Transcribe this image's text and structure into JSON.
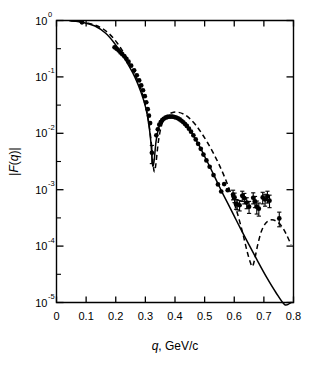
{
  "figure": {
    "name": "nuclear-form-factor-plot",
    "background": "#ffffff",
    "ink": "#000000"
  },
  "chart_data": {
    "type": "scatter",
    "title": "",
    "xlabel_italic": "q",
    "xlabel_rest": ", GeV/c",
    "xlabel": "q, GeV/c",
    "ylabel": "|F(q)|",
    "ylabel_parts": {
      "bar_left": "|",
      "f": "F",
      "paren_open": "(",
      "q": "q",
      "paren_close": ")",
      "bar_right": "|"
    },
    "xscale": "linear",
    "yscale": "log",
    "xlim": [
      0.0,
      0.8
    ],
    "ylim": [
      1e-05,
      1.0
    ],
    "grid": false,
    "legend": "none",
    "xticks": [
      0.0,
      0.1,
      0.2,
      0.3,
      0.4,
      0.5,
      0.6,
      0.7,
      0.8
    ],
    "xticklabels": [
      "0",
      "0.1",
      "0.2",
      "0.3",
      "0.4",
      "0.5",
      "0.6",
      "0.7",
      "0.8"
    ],
    "yticks": [
      1,
      0.1,
      0.01,
      0.001,
      0.0001,
      1e-05
    ],
    "yticklabels": [
      "10",
      "10",
      "10",
      "10",
      "10",
      "10"
    ],
    "ytickexponents": [
      "0",
      "-1",
      "-2",
      "-3",
      "-4",
      "-5"
    ],
    "yminor_ticks": [
      0.3162,
      0.03162,
      0.003162,
      0.0003162,
      3.162e-05
    ],
    "series": [
      {
        "name": "data",
        "style": "filled-circles-with-error-bars",
        "marker": "circle",
        "points": [
          {
            "x": 0.086,
            "y": 0.93,
            "err": 0.0
          },
          {
            "x": 0.196,
            "y": 0.335,
            "err": 0.0
          },
          {
            "x": 0.203,
            "y": 0.315,
            "err": 0.0
          },
          {
            "x": 0.21,
            "y": 0.295,
            "err": 0.0
          },
          {
            "x": 0.216,
            "y": 0.272,
            "err": 0.0
          },
          {
            "x": 0.222,
            "y": 0.253,
            "err": 0.0
          },
          {
            "x": 0.229,
            "y": 0.232,
            "err": 0.0
          },
          {
            "x": 0.236,
            "y": 0.209,
            "err": 0.0
          },
          {
            "x": 0.243,
            "y": 0.186,
            "err": 0.0
          },
          {
            "x": 0.252,
            "y": 0.158,
            "err": 0.0
          },
          {
            "x": 0.262,
            "y": 0.131,
            "err": 0.0
          },
          {
            "x": 0.271,
            "y": 0.107,
            "err": 0.0
          },
          {
            "x": 0.279,
            "y": 0.0865,
            "err": 0.0
          },
          {
            "x": 0.286,
            "y": 0.0705,
            "err": 0.0
          },
          {
            "x": 0.292,
            "y": 0.058,
            "err": 0.0
          },
          {
            "x": 0.298,
            "y": 0.0455,
            "err": 0.0
          },
          {
            "x": 0.303,
            "y": 0.0355,
            "err": 0.0
          },
          {
            "x": 0.308,
            "y": 0.0268,
            "err": 0.0
          },
          {
            "x": 0.312,
            "y": 0.0205,
            "err": 0.0
          },
          {
            "x": 0.316,
            "y": 0.0152,
            "err": 0.0
          },
          {
            "x": 0.322,
            "y": 0.0045,
            "err": 0.0016
          },
          {
            "x": 0.337,
            "y": 0.0092,
            "err": 0.0
          },
          {
            "x": 0.342,
            "y": 0.0118,
            "err": 0.0
          },
          {
            "x": 0.347,
            "y": 0.0142,
            "err": 0.0
          },
          {
            "x": 0.352,
            "y": 0.0158,
            "err": 0.0
          },
          {
            "x": 0.357,
            "y": 0.0171,
            "err": 0.0
          },
          {
            "x": 0.362,
            "y": 0.0181,
            "err": 0.0
          },
          {
            "x": 0.368,
            "y": 0.0189,
            "err": 0.0
          },
          {
            "x": 0.374,
            "y": 0.0194,
            "err": 0.0
          },
          {
            "x": 0.38,
            "y": 0.0197,
            "err": 0.0
          },
          {
            "x": 0.386,
            "y": 0.0198,
            "err": 0.0
          },
          {
            "x": 0.392,
            "y": 0.0197,
            "err": 0.0
          },
          {
            "x": 0.398,
            "y": 0.0194,
            "err": 0.0
          },
          {
            "x": 0.404,
            "y": 0.019,
            "err": 0.0
          },
          {
            "x": 0.41,
            "y": 0.0184,
            "err": 0.0
          },
          {
            "x": 0.416,
            "y": 0.0176,
            "err": 0.0
          },
          {
            "x": 0.422,
            "y": 0.0167,
            "err": 0.0
          },
          {
            "x": 0.428,
            "y": 0.0157,
            "err": 0.0
          },
          {
            "x": 0.434,
            "y": 0.0146,
            "err": 0.0
          },
          {
            "x": 0.44,
            "y": 0.0135,
            "err": 0.0
          },
          {
            "x": 0.447,
            "y": 0.0121,
            "err": 0.0
          },
          {
            "x": 0.454,
            "y": 0.0107,
            "err": 0.0
          },
          {
            "x": 0.462,
            "y": 0.0092,
            "err": 0.0
          },
          {
            "x": 0.47,
            "y": 0.0078,
            "err": 0.0
          },
          {
            "x": 0.478,
            "y": 0.0065,
            "err": 0.0
          },
          {
            "x": 0.487,
            "y": 0.0053,
            "err": 0.0
          },
          {
            "x": 0.496,
            "y": 0.0042,
            "err": 0.0
          },
          {
            "x": 0.506,
            "y": 0.0033,
            "err": 0.0
          },
          {
            "x": 0.517,
            "y": 0.00255,
            "err": 0.0
          },
          {
            "x": 0.53,
            "y": 0.00182,
            "err": 0.0
          },
          {
            "x": 0.545,
            "y": 0.00124,
            "err": 0.0
          },
          {
            "x": 0.556,
            "y": 0.00093,
            "err": 0.0
          },
          {
            "x": 0.566,
            "y": 0.00126,
            "err": 0.0
          },
          {
            "x": 0.578,
            "y": 0.00098,
            "err": 0.0
          },
          {
            "x": 0.596,
            "y": 0.00082,
            "err": 0.00016
          },
          {
            "x": 0.601,
            "y": 0.00073,
            "err": 0.00014
          },
          {
            "x": 0.606,
            "y": 0.00056,
            "err": 0.00011
          },
          {
            "x": 0.61,
            "y": 0.00055,
            "err": 0.00011
          },
          {
            "x": 0.618,
            "y": 0.00053,
            "err": 0.00011
          },
          {
            "x": 0.627,
            "y": 0.00078,
            "err": 0.00016
          },
          {
            "x": 0.634,
            "y": 0.00071,
            "err": 0.00015
          },
          {
            "x": 0.642,
            "y": 0.00059,
            "err": 0.00013
          },
          {
            "x": 0.65,
            "y": 0.0005,
            "err": 0.00012
          },
          {
            "x": 0.664,
            "y": 0.00072,
            "err": 0.00016
          },
          {
            "x": 0.67,
            "y": 0.00062,
            "err": 0.00014
          },
          {
            "x": 0.676,
            "y": 0.0005,
            "err": 0.00013
          },
          {
            "x": 0.683,
            "y": 0.00046,
            "err": 0.00012
          },
          {
            "x": 0.696,
            "y": 0.00073,
            "err": 0.00017
          },
          {
            "x": 0.704,
            "y": 0.00067,
            "err": 0.00016
          },
          {
            "x": 0.712,
            "y": 0.00076,
            "err": 0.00018
          },
          {
            "x": 0.719,
            "y": 0.00064,
            "err": 0.00016
          },
          {
            "x": 0.752,
            "y": 0.00031,
            "err": 9e-05
          }
        ]
      },
      {
        "name": "solid-model-curve",
        "style": "solid",
        "description": "theoretical form factor, solid line",
        "points": [
          {
            "x": 0.045,
            "y": 0.985
          },
          {
            "x": 0.09,
            "y": 0.925
          },
          {
            "x": 0.13,
            "y": 0.8
          },
          {
            "x": 0.165,
            "y": 0.6
          },
          {
            "x": 0.195,
            "y": 0.4
          },
          {
            "x": 0.22,
            "y": 0.255
          },
          {
            "x": 0.245,
            "y": 0.155
          },
          {
            "x": 0.265,
            "y": 0.098
          },
          {
            "x": 0.285,
            "y": 0.054
          },
          {
            "x": 0.3,
            "y": 0.03
          },
          {
            "x": 0.31,
            "y": 0.0165
          },
          {
            "x": 0.318,
            "y": 0.0075
          },
          {
            "x": 0.323,
            "y": 0.0033
          },
          {
            "x": 0.326,
            "y": 0.0026
          },
          {
            "x": 0.33,
            "y": 0.0034
          },
          {
            "x": 0.336,
            "y": 0.0072
          },
          {
            "x": 0.344,
            "y": 0.012
          },
          {
            "x": 0.355,
            "y": 0.0165
          },
          {
            "x": 0.37,
            "y": 0.0189
          },
          {
            "x": 0.385,
            "y": 0.0196
          },
          {
            "x": 0.4,
            "y": 0.0192
          },
          {
            "x": 0.42,
            "y": 0.0172
          },
          {
            "x": 0.44,
            "y": 0.0134
          },
          {
            "x": 0.46,
            "y": 0.0095
          },
          {
            "x": 0.48,
            "y": 0.0063
          },
          {
            "x": 0.5,
            "y": 0.0039
          },
          {
            "x": 0.52,
            "y": 0.0024
          },
          {
            "x": 0.54,
            "y": 0.00145
          },
          {
            "x": 0.56,
            "y": 0.00088
          },
          {
            "x": 0.58,
            "y": 0.00055
          },
          {
            "x": 0.6,
            "y": 0.00034
          },
          {
            "x": 0.62,
            "y": 0.00021
          },
          {
            "x": 0.65,
            "y": 0.000105
          },
          {
            "x": 0.68,
            "y": 5.3e-05
          },
          {
            "x": 0.71,
            "y": 2.75e-05
          },
          {
            "x": 0.74,
            "y": 1.52e-05
          },
          {
            "x": 0.77,
            "y": 9.2e-06
          },
          {
            "x": 0.792,
            "y": 1e-05
          }
        ]
      },
      {
        "name": "dashed-model-curve",
        "style": "dashed",
        "description": "alternative model, dashed line",
        "points": [
          {
            "x": 0.048,
            "y": 0.988
          },
          {
            "x": 0.095,
            "y": 0.93
          },
          {
            "x": 0.14,
            "y": 0.79
          },
          {
            "x": 0.175,
            "y": 0.6
          },
          {
            "x": 0.205,
            "y": 0.4
          },
          {
            "x": 0.23,
            "y": 0.25
          },
          {
            "x": 0.252,
            "y": 0.152
          },
          {
            "x": 0.272,
            "y": 0.092
          },
          {
            "x": 0.29,
            "y": 0.05
          },
          {
            "x": 0.303,
            "y": 0.027
          },
          {
            "x": 0.313,
            "y": 0.0135
          },
          {
            "x": 0.321,
            "y": 0.006
          },
          {
            "x": 0.327,
            "y": 0.0026
          },
          {
            "x": 0.331,
            "y": 0.0021
          },
          {
            "x": 0.336,
            "y": 0.003
          },
          {
            "x": 0.344,
            "y": 0.0072
          },
          {
            "x": 0.355,
            "y": 0.014
          },
          {
            "x": 0.37,
            "y": 0.02
          },
          {
            "x": 0.39,
            "y": 0.0232
          },
          {
            "x": 0.41,
            "y": 0.0236
          },
          {
            "x": 0.43,
            "y": 0.0218
          },
          {
            "x": 0.45,
            "y": 0.0182
          },
          {
            "x": 0.47,
            "y": 0.014
          },
          {
            "x": 0.49,
            "y": 0.01
          },
          {
            "x": 0.51,
            "y": 0.0068
          },
          {
            "x": 0.53,
            "y": 0.0044
          },
          {
            "x": 0.55,
            "y": 0.0027
          },
          {
            "x": 0.57,
            "y": 0.00155
          },
          {
            "x": 0.59,
            "y": 0.00082
          },
          {
            "x": 0.61,
            "y": 0.00039
          },
          {
            "x": 0.628,
            "y": 0.000175
          },
          {
            "x": 0.643,
            "y": 8.2e-05
          },
          {
            "x": 0.655,
            "y": 5e-05
          },
          {
            "x": 0.662,
            "y": 4.4e-05
          },
          {
            "x": 0.67,
            "y": 6.2e-05
          },
          {
            "x": 0.68,
            "y": 0.00011
          },
          {
            "x": 0.692,
            "y": 0.000185
          },
          {
            "x": 0.706,
            "y": 0.000255
          },
          {
            "x": 0.722,
            "y": 0.00029
          },
          {
            "x": 0.74,
            "y": 0.00028
          },
          {
            "x": 0.758,
            "y": 0.000232
          },
          {
            "x": 0.775,
            "y": 0.000165
          },
          {
            "x": 0.792,
            "y": 0.000105
          }
        ]
      }
    ]
  }
}
